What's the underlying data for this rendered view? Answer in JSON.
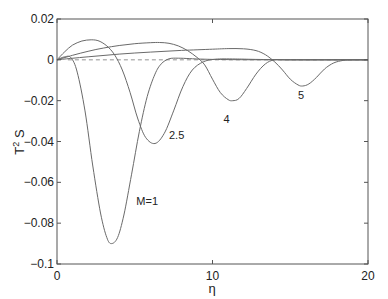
{
  "chart_data": {
    "type": "line",
    "title": "",
    "xlabel": "η",
    "ylabel": "T² S",
    "xlim": [
      0,
      20
    ],
    "ylim": [
      -0.1,
      0.02
    ],
    "xticks": [
      0,
      10,
      20
    ],
    "xtick_labels": [
      "0",
      "10",
      "20"
    ],
    "yticks": [
      0.02,
      0,
      -0.02,
      -0.04,
      -0.06,
      -0.08,
      -0.1
    ],
    "ytick_labels": [
      "0.02",
      "0",
      "−0.02",
      "−0.04",
      "−0.06",
      "−0.08",
      "−0.1"
    ],
    "grid": false,
    "legend": "none (inline curve labels)",
    "reference_line": {
      "y": 0,
      "style": "dashed"
    },
    "series": [
      {
        "name": "M=1",
        "label": "M=1",
        "label_pos": [
          5.1,
          -0.071
        ],
        "x": [
          0,
          0.5,
          0.9,
          1.3,
          1.8,
          2.3,
          2.8,
          3.2,
          3.5,
          3.9,
          4.3,
          4.8,
          5.3,
          5.8,
          6.3,
          6.7,
          7.2,
          7.8,
          8.5,
          9.5,
          11,
          14,
          20
        ],
        "y": [
          0,
          0.0015,
          0.001,
          -0.006,
          -0.025,
          -0.052,
          -0.075,
          -0.087,
          -0.09,
          -0.087,
          -0.076,
          -0.056,
          -0.035,
          -0.018,
          -0.007,
          -0.002,
          0.0005,
          0.0008,
          0.0006,
          0.0003,
          0.0001,
          0,
          0
        ]
      },
      {
        "name": "M=2.5",
        "label": "2.5",
        "label_pos": [
          7.2,
          -0.039
        ],
        "x": [
          0,
          0.5,
          1.0,
          1.6,
          2.2,
          2.7,
          3.2,
          3.7,
          4.2,
          4.7,
          5.2,
          5.7,
          6.3,
          6.9,
          7.5,
          8.1,
          8.7,
          9.4,
          10.2,
          11.5,
          14,
          20
        ],
        "y": [
          0,
          0.004,
          0.0072,
          0.0092,
          0.0098,
          0.0092,
          0.0068,
          0.0025,
          -0.005,
          -0.016,
          -0.029,
          -0.038,
          -0.041,
          -0.036,
          -0.025,
          -0.013,
          -0.005,
          -0.001,
          0.0003,
          0.0004,
          0.0001,
          0
        ]
      },
      {
        "name": "M=4",
        "label": "4",
        "label_pos": [
          10.7,
          -0.031
        ],
        "x": [
          0,
          1,
          2,
          3,
          4,
          5,
          6,
          6.6,
          7.2,
          7.8,
          8.4,
          9.0,
          9.5,
          10.0,
          10.5,
          11.0,
          11.3,
          11.7,
          12.2,
          12.8,
          13.4,
          14,
          15,
          20
        ],
        "y": [
          0,
          0.0022,
          0.0042,
          0.0058,
          0.007,
          0.0079,
          0.0084,
          0.0085,
          0.0081,
          0.0068,
          0.0045,
          0.0012,
          -0.0025,
          -0.0095,
          -0.016,
          -0.0195,
          -0.02,
          -0.019,
          -0.014,
          -0.007,
          -0.002,
          0,
          0,
          0
        ]
      },
      {
        "name": "M=5",
        "label": "5",
        "label_pos": [
          15.5,
          -0.019
        ],
        "x": [
          0,
          2,
          4,
          6,
          8,
          10,
          11,
          12,
          12.8,
          13.4,
          14.0,
          14.5,
          15.0,
          15.5,
          15.8,
          16.2,
          16.7,
          17.2,
          17.8,
          18.4,
          19,
          20
        ],
        "y": [
          0,
          0.0015,
          0.0028,
          0.0038,
          0.0046,
          0.0052,
          0.0055,
          0.0054,
          0.0045,
          0.0025,
          -0.001,
          -0.005,
          -0.0095,
          -0.0123,
          -0.0128,
          -0.0118,
          -0.0085,
          -0.0045,
          -0.0015,
          -0.0003,
          0,
          0
        ]
      }
    ]
  }
}
